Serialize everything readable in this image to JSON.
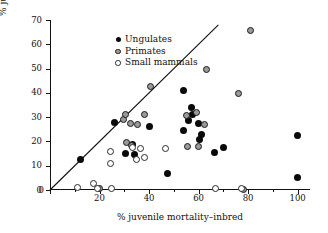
{
  "chart_data": {
    "type": "scatter",
    "title": "",
    "xlabel": "% juvenile mortality–inbred",
    "ylabel": "% juvenile mortality–outbred",
    "xlim": [
      0,
      105
    ],
    "ylim": [
      0,
      70
    ],
    "xticks": [
      0,
      20,
      40,
      60,
      80,
      100
    ],
    "xticks_minor": [
      10,
      30,
      50,
      70,
      90
    ],
    "yticks": [
      0,
      10,
      20,
      30,
      40,
      50,
      60,
      70
    ],
    "grid": false,
    "legend_position": "top-left",
    "reference_line": {
      "name": "one-to-one-line",
      "from": [
        0,
        0
      ],
      "to": [
        68,
        68
      ],
      "color": "#111111"
    },
    "series": [
      {
        "name": "Ungulates",
        "marker": "filled-circle",
        "color": "#0a0a0a",
        "points": [
          [
            12.5,
            12.5
          ],
          [
            26,
            28
          ],
          [
            30.5,
            15
          ],
          [
            33.5,
            18.7
          ],
          [
            34,
            14.8
          ],
          [
            40,
            26
          ],
          [
            47.5,
            7
          ],
          [
            54,
            41
          ],
          [
            54,
            24.5
          ],
          [
            56,
            28.5
          ],
          [
            57,
            34
          ],
          [
            57.5,
            31
          ],
          [
            60,
            27.5
          ],
          [
            60.5,
            21
          ],
          [
            61,
            23
          ],
          [
            66.5,
            15.5
          ],
          [
            70,
            17.5
          ],
          [
            100,
            22.3
          ],
          [
            100,
            5
          ]
        ]
      },
      {
        "name": "Primates",
        "marker": "gray-circle",
        "color": "#9a9a9a",
        "points": [
          [
            29.5,
            29
          ],
          [
            30.5,
            31
          ],
          [
            31,
            19.5
          ],
          [
            32.5,
            27.5
          ],
          [
            33,
            18.5
          ],
          [
            35.5,
            27
          ],
          [
            38,
            31
          ],
          [
            40.5,
            42.5
          ],
          [
            55,
            30.5
          ],
          [
            55.5,
            18
          ],
          [
            59,
            32
          ],
          [
            60,
            17.8
          ],
          [
            62.5,
            26.8
          ],
          [
            63,
            49.5
          ],
          [
            76,
            39.8
          ],
          [
            78,
            0.4
          ],
          [
            81,
            65.5
          ],
          [
            20,
            0.5
          ]
        ]
      },
      {
        "name": "Small mammals",
        "marker": "open-circle",
        "color": "#ffffff",
        "points": [
          [
            11,
            1
          ],
          [
            17.5,
            2.8
          ],
          [
            19,
            0.6
          ],
          [
            24.5,
            16
          ],
          [
            24.5,
            10.8
          ],
          [
            25,
            0.7
          ],
          [
            33.5,
            17.3
          ],
          [
            35,
            12.5
          ],
          [
            36.5,
            17
          ],
          [
            38,
            13.2
          ],
          [
            46.5,
            17
          ],
          [
            67,
            0.7
          ],
          [
            77.5,
            0.6
          ]
        ]
      }
    ]
  },
  "legend": {
    "items": [
      {
        "label": "Ungulates",
        "marker": "ungulate"
      },
      {
        "label": "Primates",
        "marker": "primate"
      },
      {
        "label": "Small mammals",
        "marker": "small"
      }
    ]
  }
}
